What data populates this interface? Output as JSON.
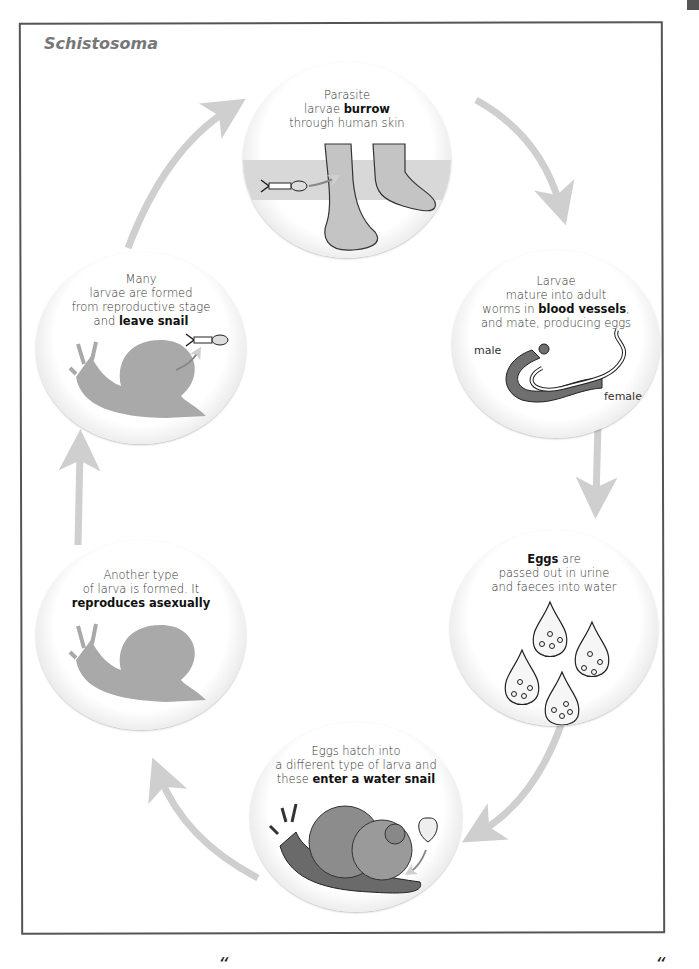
{
  "title": "Schistosoma",
  "colors": {
    "frame": "#555555",
    "arrow": "#cfcfcf",
    "silhouette": "#a9a9a9",
    "worm_male": "#6f6f6f",
    "snail_shell": "#8c8c8c",
    "title_text": "#777777"
  },
  "stages": [
    {
      "id": "burrow",
      "text_before": "Parasite\nlarvae ",
      "bold": "burrow",
      "text_after": "\nthrough human skin",
      "lines": [
        "Parasite",
        "larvae ",
        "burrow",
        "through human skin"
      ],
      "illustration": "feet-in-water-with-larva"
    },
    {
      "id": "mature",
      "lines": [
        "Larvae",
        "mature into adult",
        "worms in ",
        "blood vessels",
        ",",
        "and mate, producing eggs"
      ],
      "labels": {
        "male": "male",
        "female": "female"
      },
      "illustration": "male-and-female-worms"
    },
    {
      "id": "eggs",
      "lines": [
        "Eggs",
        " are",
        "passed out in urine",
        "and faeces into water"
      ],
      "illustration": "egg-drops"
    },
    {
      "id": "hatch",
      "lines": [
        "Eggs hatch into",
        "a different type of larva and",
        "these ",
        "enter a water snail"
      ],
      "illustration": "water-snail-with-larva"
    },
    {
      "id": "asexual",
      "lines": [
        "Another type",
        "of larva is formed. It",
        "reproduces asexually"
      ],
      "illustration": "snail-silhouette"
    },
    {
      "id": "leave",
      "lines": [
        "Many",
        "larvae are formed",
        "from reproductive stage",
        "and ",
        "leave snail"
      ],
      "illustration": "snail-silhouette-with-larva-leaving"
    }
  ],
  "footer_marks": [
    "“",
    "“"
  ]
}
